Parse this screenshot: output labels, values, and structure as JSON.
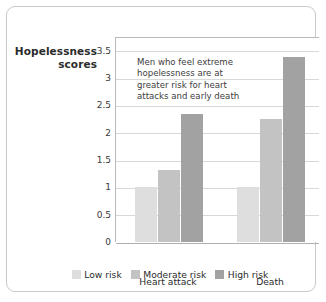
{
  "chart_data": {
    "type": "bar",
    "title": "",
    "xlabel": "",
    "ylabel": "Hopelessness scores",
    "categories": [
      "Heart attack",
      "Death"
    ],
    "series": [
      {
        "name": "Low risk",
        "values": [
          1,
          1
        ],
        "color": "#dedede"
      },
      {
        "name": "Moderate risk",
        "values": [
          1.32,
          2.25
        ],
        "color": "#c3c3c3"
      },
      {
        "name": "High risk",
        "values": [
          2.35,
          3.39
        ],
        "color": "#a2a2a2"
      }
    ],
    "ylim": [
      0,
      3.75
    ],
    "yticks": [
      0,
      0.5,
      1,
      1.5,
      2,
      2.5,
      3,
      3.5
    ],
    "ytick_labels": [
      "0",
      "0.5",
      "1",
      "1.5",
      "2",
      "2.5",
      "3",
      "3.5"
    ],
    "grid": true,
    "legend_position": "bottom",
    "annotation": [
      "Men who feel extreme",
      "hopelessness are at",
      "greater risk for heart",
      "attacks and early death"
    ]
  },
  "axis_title": {
    "line1": "Hopelessness",
    "line2": "scores"
  },
  "colors": {
    "low_risk": "#dedede",
    "moderate_risk": "#c3c3c3",
    "high_risk": "#a2a2a2",
    "gridline": "#d8d8d8",
    "axis": "#b0b0b0",
    "card_border": "#c9c9c9",
    "text": "#2b2b2b"
  }
}
